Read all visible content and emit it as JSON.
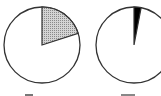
{
  "chart_data": [
    {
      "type": "pie",
      "title": "",
      "categories": [
        "shaded",
        "remainder"
      ],
      "values": [
        20,
        80
      ],
      "colors": [
        "#bdbdbd",
        "#ffffff"
      ],
      "fill_pattern": "stippled",
      "start_angle_deg": 0,
      "direction": "clockwise",
      "label": ""
    },
    {
      "type": "pie",
      "title": "",
      "categories": [
        "black",
        "remainder"
      ],
      "values": [
        3,
        97
      ],
      "colors": [
        "#000000",
        "#ffffff"
      ],
      "start_angle_deg": 0,
      "direction": "clockwise",
      "label": ""
    }
  ],
  "style": {
    "outline": "#333333",
    "background": "#ffffff"
  }
}
